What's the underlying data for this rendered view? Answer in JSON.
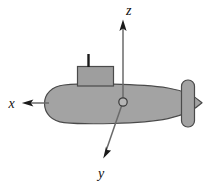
{
  "figure": {
    "background_color": "#ffffff",
    "width": 207,
    "height": 186
  },
  "colors": {
    "hull_fill": "#a3a3a3",
    "hull_stroke": "#4a4a4a",
    "sail_fill": "#9e9e9e",
    "sail_stroke": "#4a4a4a",
    "rudder_fill": "#a3a3a3",
    "rudder_stroke": "#4a4a4a",
    "mast_fill": "#1a1a1a",
    "axis_stroke": "#555555",
    "arrow_fill": "#1a1a1a",
    "origin_fill": "#b5b5b5",
    "origin_stroke": "#3a3a3a",
    "label_color": "#111111"
  },
  "axes": [
    {
      "name": "z",
      "label": "z",
      "direction": "up",
      "origin": {
        "x": 123,
        "y": 102
      },
      "tip": {
        "x": 123,
        "y": 20
      },
      "label_position": {
        "x": 126,
        "y": 14
      }
    },
    {
      "name": "x",
      "label": "x",
      "direction": "left",
      "origin": {
        "x": 48,
        "y": 103
      },
      "tip": {
        "x": 22,
        "y": 103
      },
      "label_position": {
        "x": 8,
        "y": 108
      }
    },
    {
      "name": "y",
      "label": "y",
      "direction": "down-left",
      "origin": {
        "x": 123,
        "y": 102
      },
      "tip": {
        "x": 103,
        "y": 158
      },
      "label_position": {
        "x": 98,
        "y": 177
      }
    }
  ],
  "vehicle": {
    "name": "submarine",
    "parts": [
      {
        "name": "hull",
        "shape": "tapered-ellipse"
      },
      {
        "name": "sail",
        "shape": "rectangle"
      },
      {
        "name": "periscope-mast",
        "shape": "line"
      },
      {
        "name": "rudder",
        "shape": "rounded-rectangle"
      }
    ]
  },
  "origin_marker": {
    "name": "origin",
    "x": 123,
    "y": 102,
    "radius": 4.2
  }
}
